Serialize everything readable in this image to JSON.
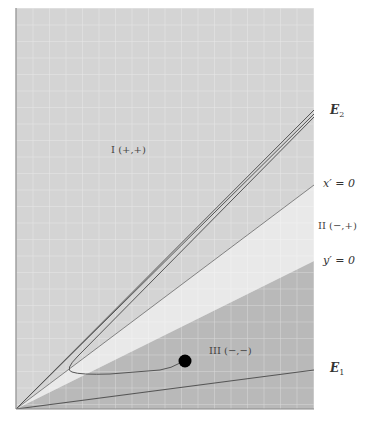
{
  "diagram": {
    "type": "phase-plane",
    "colors": {
      "region_I": "#d4d4d4",
      "region_II": "#e8e8e8",
      "region_III": "#b8b8b8",
      "grid": "#e6e6e6",
      "line": "#555555",
      "dot": "#000000",
      "frame": "#8a8a8a"
    },
    "labels": {
      "region_I": "I (+,+)",
      "region_II": "II (−,+)",
      "region_III": "III (−,−)",
      "e2": "E",
      "e2_sub": "2",
      "e1": "E",
      "e1_sub": "1",
      "x_nullcline": "x′ = 0",
      "y_nullcline": "y′ = 0"
    },
    "lines": [
      {
        "name": "E2 eigen-direction",
        "from": [
          16,
          409
        ],
        "to": [
          314,
          112
        ],
        "style": "double"
      },
      {
        "name": "x' = 0 nullcline",
        "from": [
          16,
          409
        ],
        "to": [
          314,
          185
        ]
      },
      {
        "name": "y' = 0 nullcline",
        "from": [
          16,
          409
        ],
        "to": [
          314,
          261
        ]
      },
      {
        "name": "E1 eigen-direction",
        "from": [
          16,
          409
        ],
        "to": [
          314,
          370
        ]
      }
    ],
    "trajectory_point": {
      "x": 185,
      "y": 361
    }
  }
}
